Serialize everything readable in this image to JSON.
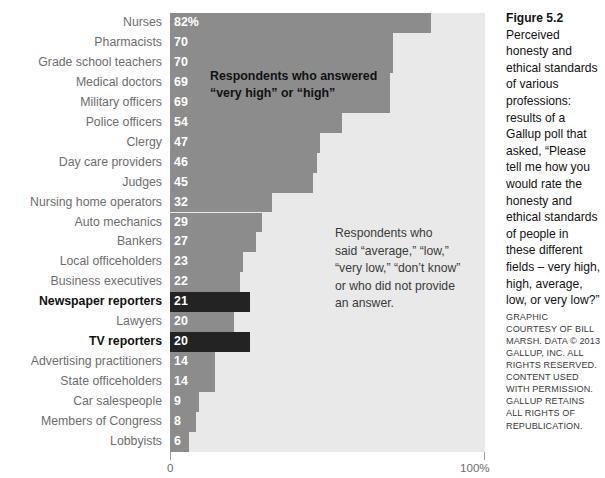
{
  "figure": {
    "title": "Figure 5.2",
    "caption": "Perceived honesty and ethical standards of various professions: results of a Gallup poll that asked, “Please tell me how you would rate the honesty and ethical standards of people in these different fields – very high, high, average, low, or very low?”",
    "credit": "GRAPHIC COURTESY OF BILL MARSH. DATA © 2013 GALLUP, INC. ALL RIGHTS RESERVED. CONTENT USED WITH PERMISSION. GALLUP RETAINS ALL RIGHTS OF REPUBLICATION."
  },
  "annotations": {
    "high_label": "Respondents who answered\n“very high” or “high”",
    "other_label": "Respondents who\nsaid “average,” “low,”\n“very low,” “don’t know”\nor who did not provide\nan answer."
  },
  "axis": {
    "tick_min": "0",
    "tick_max": "100%"
  },
  "colors": {
    "bar": "#8c8c8c",
    "bar_highlight": "#232323",
    "plot_background": "#e9e9e9",
    "label": "#6d6d6d",
    "label_highlight": "#111111"
  },
  "chart_data": {
    "type": "bar",
    "orientation": "horizontal",
    "title": "Figure 5.2",
    "xlabel": "",
    "ylabel": "",
    "xlim": [
      0,
      100
    ],
    "grid": false,
    "legend": "none",
    "categories": [
      "Nurses",
      "Pharmacists",
      "Grade school teachers",
      "Medical doctors",
      "Military officers",
      "Police officers",
      "Clergy",
      "Day care providers",
      "Judges",
      "Nursing home operators",
      "Auto mechanics",
      "Bankers",
      "Local officeholders",
      "Business executives",
      "Newspaper reporters",
      "Lawyers",
      "TV reporters",
      "Advertising practitioners",
      "State officeholders",
      "Car salespeople",
      "Members of Congress",
      "Lobbyists"
    ],
    "values": [
      82,
      70,
      70,
      69,
      69,
      54,
      47,
      46,
      45,
      32,
      29,
      27,
      23,
      22,
      21,
      20,
      20,
      14,
      14,
      9,
      8,
      6
    ],
    "value_labels": [
      "82%",
      "70",
      "70",
      "69",
      "69",
      "54",
      "47",
      "46",
      "45",
      "32",
      "29",
      "27",
      "23",
      "22",
      "21",
      "20",
      "20",
      "14",
      "14",
      "9",
      "8",
      "6"
    ],
    "highlighted": [
      false,
      false,
      false,
      false,
      false,
      false,
      false,
      false,
      false,
      false,
      false,
      false,
      false,
      false,
      true,
      false,
      true,
      false,
      false,
      false,
      false,
      false
    ],
    "bar_pixel_widths": [
      261,
      223,
      223,
      220,
      220,
      172,
      150,
      147,
      143,
      102,
      92,
      86,
      73,
      70,
      80,
      64,
      80,
      45,
      45,
      29,
      26,
      19
    ]
  }
}
